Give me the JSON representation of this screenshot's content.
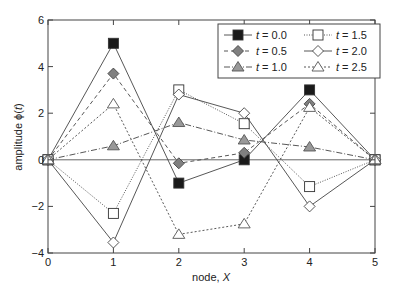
{
  "chart_data": {
    "type": "line",
    "title": "",
    "xlabel": "node, ",
    "xlabel_italic": "X",
    "ylabel": "amplitude ϕ(",
    "ylabel_italic": "t",
    "ylabel_suffix": ")",
    "xlim": [
      0,
      5
    ],
    "ylim": [
      -4,
      6
    ],
    "x": [
      0,
      1,
      2,
      3,
      4,
      5
    ],
    "xticks": [
      "0",
      "1",
      "2",
      "3",
      "4",
      "5"
    ],
    "yticks": [
      "-4",
      "-2",
      "0",
      "2",
      "4",
      "6"
    ],
    "ytick_values": [
      -4,
      -2,
      0,
      2,
      4,
      6
    ],
    "zero_line": true,
    "grid": false,
    "legend_position": "top-right",
    "series": [
      {
        "name": "t = 0.0",
        "t_label": "t",
        "t_value": " = 0.0",
        "values": [
          0,
          5.0,
          -1.0,
          0.0,
          3.0,
          0
        ],
        "marker": "square",
        "fill": "#1a1a1a",
        "dash": "none"
      },
      {
        "name": "t = 0.5",
        "t_label": "t",
        "t_value": " = 0.5",
        "values": [
          0,
          3.7,
          -0.15,
          0.3,
          2.4,
          0
        ],
        "marker": "diamond",
        "fill": "#808080",
        "dash": "4,3"
      },
      {
        "name": "t = 1.0",
        "t_label": "t",
        "t_value": " = 1.0",
        "values": [
          0,
          0.6,
          1.6,
          0.85,
          0.55,
          0
        ],
        "marker": "triangle",
        "fill": "#999999",
        "dash": "6,2,1,2"
      },
      {
        "name": "t = 1.5",
        "t_label": "t",
        "t_value": " = 1.5",
        "values": [
          0,
          -2.3,
          3.0,
          1.55,
          -1.15,
          0
        ],
        "marker": "square",
        "fill": "#ffffff",
        "dash": "1,1.5"
      },
      {
        "name": "t = 2.0",
        "t_label": "t",
        "t_value": " = 2.0",
        "values": [
          0,
          -3.55,
          2.8,
          2.0,
          -2.0,
          0
        ],
        "marker": "diamond",
        "fill": "#ffffff",
        "dash": "none"
      },
      {
        "name": "t = 2.5",
        "t_label": "t",
        "t_value": " = 2.5",
        "values": [
          0,
          2.4,
          -3.2,
          -2.75,
          2.25,
          0
        ],
        "marker": "triangle",
        "fill": "#ffffff",
        "dash": "2,2"
      }
    ]
  }
}
